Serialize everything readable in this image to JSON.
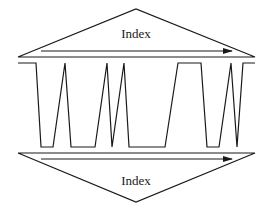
{
  "diagram": {
    "top_triangle": {
      "label": "Index",
      "apex": [
        136,
        9
      ],
      "left": [
        18,
        57
      ],
      "right": [
        255,
        57
      ],
      "arrow": {
        "from": [
          41,
          51
        ],
        "to": [
          232,
          51
        ]
      }
    },
    "waveform": {
      "top_y": 63,
      "bottom_y": 147,
      "points": [
        [
          18,
          63
        ],
        [
          36,
          63
        ],
        [
          41,
          147
        ],
        [
          53,
          147
        ],
        [
          65,
          63
        ],
        [
          71,
          147
        ],
        [
          95,
          147
        ],
        [
          107,
          63
        ],
        [
          112,
          147
        ],
        [
          124,
          63
        ],
        [
          129,
          147
        ],
        [
          165,
          147
        ],
        [
          178,
          63
        ],
        [
          201,
          63
        ],
        [
          207,
          147
        ],
        [
          219,
          147
        ],
        [
          231,
          63
        ],
        [
          237,
          147
        ],
        [
          243,
          63
        ],
        [
          255,
          63
        ]
      ]
    },
    "bottom_triangle": {
      "label": "Index",
      "apex": [
        136,
        202
      ],
      "left": [
        18,
        153
      ],
      "right": [
        255,
        153
      ],
      "arrow": {
        "from": [
          41,
          159
        ],
        "to": [
          232,
          159
        ]
      }
    },
    "colors": {
      "stroke": "#1a1a1a",
      "background": "#ffffff"
    }
  }
}
